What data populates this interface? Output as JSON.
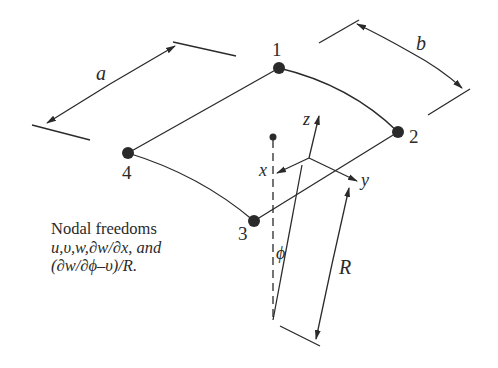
{
  "figure": {
    "type": "shell finite element diagram",
    "nodes": [
      {
        "id": "1",
        "label": "1"
      },
      {
        "id": "2",
        "label": "2"
      },
      {
        "id": "3",
        "label": "3"
      },
      {
        "id": "4",
        "label": "4"
      }
    ],
    "dimensions": {
      "a": "a",
      "b": "b",
      "R": "R"
    },
    "axes": {
      "x": "x",
      "y": "y",
      "z": "z"
    },
    "angle_label": "ϕ",
    "caption": {
      "line1": "Nodal freedoms",
      "line2": "u,υ,w,∂w/∂x, and",
      "line3": "(∂w/∂ϕ–υ)/R."
    },
    "colors": {
      "ink": "#2a2a2a",
      "background": "#ffffff"
    }
  }
}
